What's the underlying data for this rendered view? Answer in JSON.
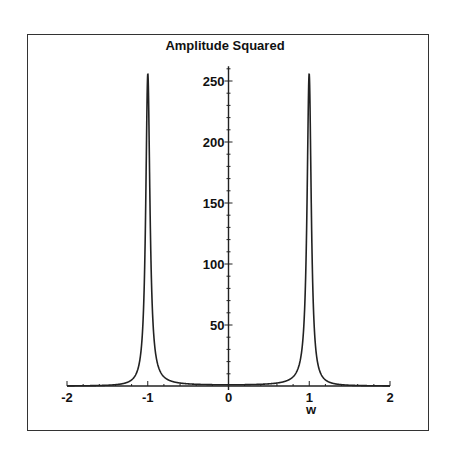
{
  "chart_data": {
    "type": "line",
    "title": "Amplitude Squared",
    "xlabel": "w",
    "ylabel": "",
    "xlim": [
      -2,
      2
    ],
    "ylim": [
      0,
      262
    ],
    "x_ticks": [
      "-2",
      "-1",
      "0",
      "1",
      "2"
    ],
    "y_ticks": [
      "50",
      "100",
      "150",
      "200",
      "250"
    ],
    "grid": false,
    "legend": null,
    "series": [
      {
        "name": "Amplitude Squared",
        "formula": "1/((1-w^2)^2 + (w/16)^2)",
        "x": [
          -2,
          -1.8,
          -1.6,
          -1.4,
          -1.3,
          -1.2,
          -1.15,
          -1.1,
          -1.07,
          -1.05,
          -1.03,
          -1.02,
          -1.01,
          -1.0,
          -0.99,
          -0.98,
          -0.97,
          -0.95,
          -0.93,
          -0.9,
          -0.85,
          -0.8,
          -0.7,
          -0.6,
          -0.4,
          -0.2,
          0,
          0.2,
          0.4,
          0.6,
          0.7,
          0.8,
          0.85,
          0.9,
          0.93,
          0.95,
          0.97,
          0.98,
          0.99,
          1.0,
          1.01,
          1.02,
          1.03,
          1.05,
          1.07,
          1.1,
          1.15,
          1.2,
          1.3,
          1.4,
          1.6,
          1.8,
          2
        ],
        "y": [
          0.11,
          0.2,
          0.41,
          1.04,
          1.69,
          4.7,
          9.8,
          18.8,
          38,
          62,
          110,
          150,
          200,
          256,
          200,
          150,
          110,
          62,
          38,
          19.5,
          10.1,
          7.8,
          3.8,
          2.4,
          1.4,
          1.1,
          1.0,
          1.1,
          1.4,
          2.4,
          3.8,
          7.8,
          10.1,
          19.5,
          38,
          62,
          110,
          150,
          200,
          256,
          200,
          150,
          110,
          62,
          38,
          18.8,
          9.8,
          4.7,
          1.69,
          1.04,
          0.41,
          0.2,
          0.11
        ]
      }
    ]
  }
}
